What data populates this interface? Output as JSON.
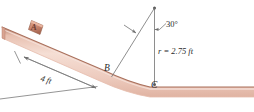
{
  "figure": {
    "colors": {
      "ramp_light": "#f0ccc0",
      "ramp_mid": "#e3b3a4",
      "ramp_edge": "#b07a66",
      "ramp_dark": "#8a5644",
      "line": "#6e6e6e",
      "text": "#2b2b2b",
      "block": "#c98a74"
    },
    "labels": {
      "block_A": "A",
      "point_B": "B",
      "point_C": "C",
      "angle": "30°",
      "radius": "r = 2.75 ft",
      "dimension": "4 ft"
    },
    "geometry": {
      "angle_deg": 30,
      "radius_value": 2.75,
      "radius_unit": "ft",
      "incline_length_value": 4,
      "incline_length_unit": "ft"
    }
  }
}
